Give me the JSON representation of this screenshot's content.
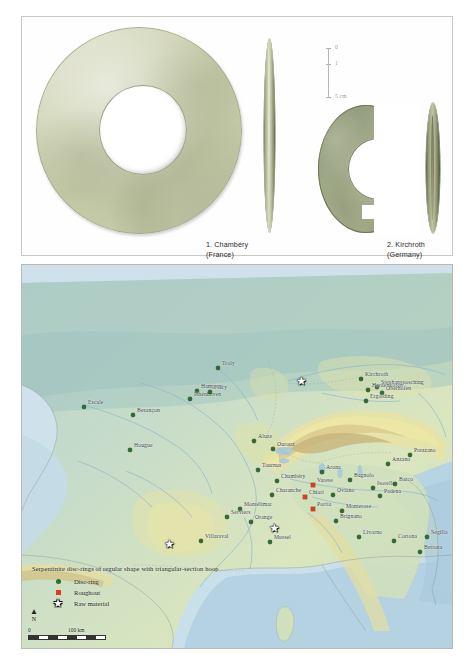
{
  "figure": {
    "photo_panel": {
      "objects": [
        {
          "id": "disc-ring-chambery",
          "label": "1. Chambéry",
          "sublabel": "(France)"
        },
        {
          "id": "fragment-kirchroth",
          "label": "2. Kirchroth",
          "sublabel": "(Germany)"
        }
      ],
      "scale": {
        "ticks": [
          "0",
          "1",
          "5 cm"
        ],
        "unit": "cm"
      }
    },
    "map": {
      "legend": {
        "title": "Serpentinite disc-rings of regular shape with triangular-section hoop",
        "items": [
          {
            "symbol": "circle",
            "label": "Disc-ring",
            "color": "#2e6b33"
          },
          {
            "symbol": "square",
            "label": "Roughout",
            "color": "#e03b20"
          },
          {
            "symbol": "star",
            "label": "Raw material",
            "color": "#ffffff"
          }
        ]
      },
      "north_arrow": {
        "label": "N"
      },
      "scale_bar": {
        "min": "0",
        "max": "100 km"
      },
      "sites": [
        {
          "name": "Escale",
          "type": "disc-ring",
          "x": 62,
          "y": 142
        },
        {
          "name": "Troly",
          "type": "disc-ring",
          "x": 196,
          "y": 103
        },
        {
          "name": "Besançon",
          "type": "disc-ring",
          "x": 111,
          "y": 150
        },
        {
          "name": "Hampont",
          "type": "disc-ring",
          "x": 175,
          "y": 126
        },
        {
          "name": "Ishénhoven",
          "type": "disc-ring",
          "x": 168,
          "y": 134
        },
        {
          "name": "Flacy",
          "type": "disc-ring",
          "x": 188,
          "y": 127
        },
        {
          "name": "Hougue",
          "type": "disc-ring",
          "x": 108,
          "y": 185
        },
        {
          "name": "Aluze",
          "type": "disc-ring",
          "x": 232,
          "y": 176
        },
        {
          "name": "Ouroux",
          "type": "disc-ring",
          "x": 251,
          "y": 184
        },
        {
          "name": "Tournus",
          "type": "disc-ring",
          "x": 236,
          "y": 205
        },
        {
          "name": "Chambéry",
          "type": "disc-ring",
          "x": 255,
          "y": 216
        },
        {
          "name": "Charanche",
          "type": "disc-ring",
          "x": 250,
          "y": 230
        },
        {
          "name": "Montélimar",
          "type": "disc-ring",
          "x": 218,
          "y": 244
        },
        {
          "name": "Serviers",
          "type": "disc-ring",
          "x": 205,
          "y": 252
        },
        {
          "name": "Orange",
          "type": "disc-ring",
          "x": 229,
          "y": 257
        },
        {
          "name": "Villaraval",
          "type": "disc-ring",
          "x": 179,
          "y": 276
        },
        {
          "name": "Mussel",
          "type": "disc-ring",
          "x": 248,
          "y": 277
        },
        {
          "name": "Arona",
          "type": "disc-ring",
          "x": 300,
          "y": 207
        },
        {
          "name": "Varese",
          "type": "roughout",
          "x": 291,
          "y": 220
        },
        {
          "name": "Chiari",
          "type": "roughout",
          "x": 283,
          "y": 232
        },
        {
          "name": "Bagnolo",
          "type": "disc-ring",
          "x": 328,
          "y": 215
        },
        {
          "name": "Oviano",
          "type": "disc-ring",
          "x": 311,
          "y": 230
        },
        {
          "name": "Portia",
          "type": "roughout",
          "x": 291,
          "y": 244
        },
        {
          "name": "Monterose",
          "type": "disc-ring",
          "x": 320,
          "y": 246
        },
        {
          "name": "Brignano",
          "type": "disc-ring",
          "x": 314,
          "y": 256
        },
        {
          "name": "Isorella",
          "type": "disc-ring",
          "x": 351,
          "y": 223
        },
        {
          "name": "Padena",
          "type": "disc-ring",
          "x": 358,
          "y": 231
        },
        {
          "name": "Barco",
          "type": "disc-ring",
          "x": 373,
          "y": 219
        },
        {
          "name": "Anzano",
          "type": "disc-ring",
          "x": 366,
          "y": 199
        },
        {
          "name": "Prezzano",
          "type": "disc-ring",
          "x": 388,
          "y": 190
        },
        {
          "name": "Livorno",
          "type": "disc-ring",
          "x": 337,
          "y": 272
        },
        {
          "name": "Cortona",
          "type": "disc-ring",
          "x": 372,
          "y": 276
        },
        {
          "name": "Segilla",
          "type": "disc-ring",
          "x": 405,
          "y": 272
        },
        {
          "name": "Bettona",
          "type": "disc-ring",
          "x": 398,
          "y": 287
        },
        {
          "name": "Kirchroth",
          "type": "disc-ring",
          "x": 339,
          "y": 114
        },
        {
          "name": "Stephansposching",
          "type": "disc-ring",
          "x": 355,
          "y": 122
        },
        {
          "name": "Hardenkofen",
          "type": "disc-ring",
          "x": 346,
          "y": 125
        },
        {
          "name": "Oberhofen",
          "type": "disc-ring",
          "x": 360,
          "y": 128
        },
        {
          "name": "Ergolding",
          "type": "disc-ring",
          "x": 344,
          "y": 136
        }
      ],
      "raw_material_stars": [
        {
          "x": 148,
          "y": 279
        },
        {
          "x": 253,
          "y": 263
        },
        {
          "x": 280,
          "y": 116
        }
      ]
    }
  }
}
